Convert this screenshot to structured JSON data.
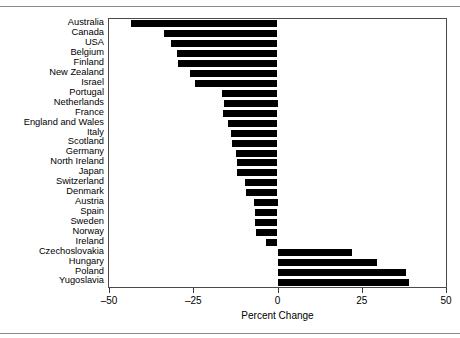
{
  "chart_data": {
    "type": "bar",
    "orientation": "horizontal",
    "title": "",
    "xlabel": "Percent Change",
    "ylabel": "",
    "xlim": [
      -50,
      50
    ],
    "xticks": [
      -50,
      -25,
      0,
      25,
      50
    ],
    "xticklabels": [
      "–50",
      "–25",
      "0",
      "25",
      "50"
    ],
    "grid": false,
    "legend": null,
    "bar_color": "#000000",
    "categories": [
      "Australia",
      "Canada",
      "USA",
      "Belgium",
      "Finland",
      "New Zealand",
      "Israel",
      "Portugal",
      "Netherlands",
      "France",
      "England and Wales",
      "Italy",
      "Scotland",
      "Germany",
      "North Ireland",
      "Japan",
      "Switzerland",
      "Denmark",
      "Austria",
      "Spain",
      "Sweden",
      "Norway",
      "Ireland",
      "Czechoslovakia",
      "Hungary",
      "Poland",
      "Yugoslavia"
    ],
    "values": [
      -43.5,
      -33.6,
      -31.5,
      -29.8,
      -29.5,
      -25.9,
      -24.4,
      -16.4,
      -15.8,
      -16.1,
      -14.6,
      -13.7,
      -13.4,
      -12.2,
      -12.0,
      -11.9,
      -9.6,
      -9.4,
      -6.9,
      -6.8,
      -6.6,
      -6.5,
      -3.3,
      22.0,
      29.5,
      38.0,
      39.0
    ]
  },
  "axis": {
    "x_title": "Percent Change"
  }
}
